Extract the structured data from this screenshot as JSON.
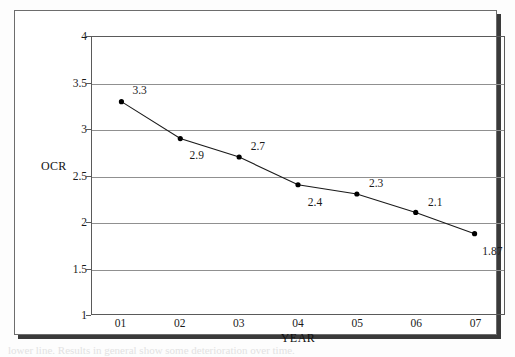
{
  "figure": {
    "axis_title_y": "OCR",
    "axis_title_x": "YEAR",
    "caption_partial": "lower line. Results in general show some deterioration over time."
  },
  "chart_data": {
    "type": "line",
    "title": "",
    "xlabel": "YEAR",
    "ylabel": "OCR",
    "categories": [
      "01",
      "02",
      "03",
      "04",
      "05",
      "06",
      "07"
    ],
    "values": [
      3.3,
      2.9,
      2.7,
      2.4,
      2.3,
      2.1,
      1.87
    ],
    "point_labels": [
      "3.3",
      "2.9",
      "2.7",
      "2.4",
      "2.3",
      "2.1",
      "1.87"
    ],
    "label_positions": [
      "above-right",
      "below-right",
      "above-right",
      "below-right",
      "above-right",
      "above-right",
      "below-right"
    ],
    "ylim": [
      1,
      4
    ],
    "ytick_values": [
      1,
      1.5,
      2,
      2.5,
      3,
      3.5,
      4
    ],
    "ytick_labels": [
      "1",
      "1.5",
      "2",
      "2.5",
      "3",
      "3.5",
      "4"
    ],
    "grid": true,
    "grid_axis": "y",
    "legend": "none",
    "marker": "filled-circle",
    "line_color": "#1a1a1a",
    "marker_color": "#000000",
    "grid_color": "#909090"
  }
}
